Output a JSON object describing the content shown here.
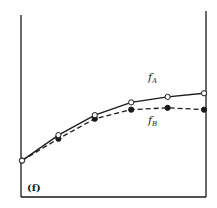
{
  "chart_data": {
    "type": "line",
    "title": "",
    "panel_label": "(f)",
    "xlabel": "",
    "ylabel": "",
    "grid": false,
    "legend": "inline labels",
    "x": [
      0,
      1,
      2,
      3,
      4,
      5
    ],
    "series": [
      {
        "name": "f_A",
        "label_main": "f",
        "label_sub": "A",
        "style": "solid",
        "marker": "open-circle",
        "values": [
          0.2,
          0.34,
          0.45,
          0.52,
          0.55,
          0.57
        ]
      },
      {
        "name": "f_B",
        "label_main": "f",
        "label_sub": "B",
        "style": "dashed",
        "marker": "filled-circle",
        "values": [
          0.2,
          0.32,
          0.43,
          0.48,
          0.49,
          0.48
        ]
      }
    ],
    "ylim": [
      0,
      1
    ],
    "xlim": [
      0,
      5
    ],
    "colors": {
      "line": "#1a1a1a",
      "background": "#ffffff"
    }
  }
}
